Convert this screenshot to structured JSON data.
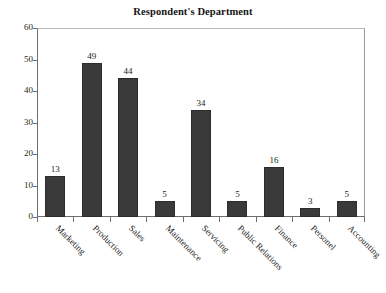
{
  "chart_data": {
    "type": "bar",
    "title": "Respondent's Department",
    "xlabel": "",
    "ylabel": "",
    "ylim": [
      0,
      60
    ],
    "yticks": [
      0,
      10,
      20,
      30,
      40,
      50,
      60
    ],
    "grid": false,
    "legend": false,
    "bar_color": "#3a3a3a",
    "categories": [
      "Marketing",
      "Production",
      "Sales",
      "Maintenance",
      "Servicing",
      "Public Relations",
      "Finance",
      "Personel",
      "Accounting"
    ],
    "values": [
      13,
      49,
      44,
      5,
      34,
      5,
      16,
      3,
      5
    ],
    "data_labels": [
      "13",
      "49",
      "44",
      "5",
      "34",
      "5",
      "16",
      "3",
      "5"
    ],
    "ytick_labels": [
      "0",
      "10",
      "20",
      "30",
      "40",
      "50",
      "60"
    ]
  }
}
